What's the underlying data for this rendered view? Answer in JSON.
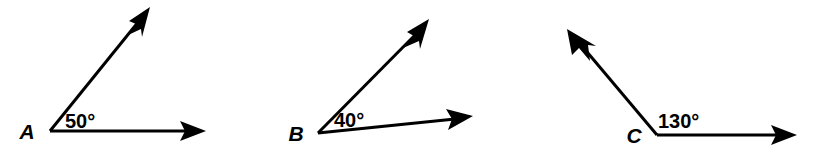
{
  "figure": {
    "background_color": "#ffffff",
    "stroke_color": "#000000",
    "canvas": {
      "width": 814,
      "height": 151
    },
    "angles": [
      {
        "id": "angle-a",
        "vertex_label": "A",
        "measure_label": "50°",
        "measure_value": 50,
        "vertex": {
          "x": 50,
          "y": 131
        },
        "vertex_label_pos": {
          "x": 27,
          "y": 139
        },
        "measure_label_pos": {
          "x": 65,
          "y": 128
        },
        "rays": [
          {
            "name": "upper-ray",
            "tip": {
              "x": 149,
              "y": 10
            },
            "direction_deg": 59
          },
          {
            "name": "horizontal-ray",
            "tip": {
              "x": 205,
              "y": 131
            },
            "direction_deg": 0
          }
        ]
      },
      {
        "id": "angle-b",
        "vertex_label": "B",
        "measure_label": "40°",
        "measure_value": 40,
        "vertex": {
          "x": 318,
          "y": 133
        },
        "vertex_label_pos": {
          "x": 296,
          "y": 141
        },
        "measure_label_pos": {
          "x": 334,
          "y": 127
        },
        "rays": [
          {
            "name": "upper-ray",
            "tip": {
              "x": 427,
              "y": 22
            },
            "direction_deg": 45
          },
          {
            "name": "lower-ray",
            "tip": {
              "x": 472,
              "y": 117
            },
            "direction_deg": 6
          }
        ]
      },
      {
        "id": "angle-c",
        "vertex_label": "C",
        "measure_label": "130°",
        "measure_value": 130,
        "vertex": {
          "x": 657,
          "y": 135
        },
        "vertex_label_pos": {
          "x": 634,
          "y": 143
        },
        "measure_label_pos": {
          "x": 658,
          "y": 128
        },
        "rays": [
          {
            "name": "upper-left-ray",
            "tip": {
              "x": 569,
              "y": 33
            },
            "direction_deg": 131
          },
          {
            "name": "horizontal-ray",
            "tip": {
              "x": 796,
              "y": 135
            },
            "direction_deg": 0
          }
        ]
      }
    ]
  }
}
